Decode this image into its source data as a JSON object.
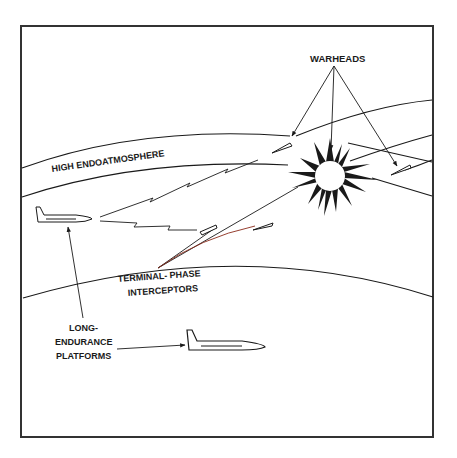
{
  "diagram": {
    "labels": {
      "warheads": "WARHEADS",
      "high_endoatmosphere": "HIGH ENDOATMOSPHERE",
      "terminal_phase_line1": "TERMINAL- PHASE",
      "terminal_phase_line2": "INTERCEPTORS",
      "platforms_line1": "LONG-",
      "platforms_line2": "ENDURANCE",
      "platforms_line3": "PLATFORMS"
    },
    "colors": {
      "ink": "#1a1a1a",
      "background": "#ffffff",
      "frame": "#333333"
    }
  }
}
